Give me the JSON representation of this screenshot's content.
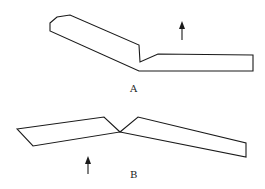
{
  "figures": [
    {
      "id": "A",
      "label": "A",
      "description": "Bent plate / bar shape with arrow pointing up",
      "outline_points": "50,23 57,17 70,15 139,45 140,62 158,54 253,55 253,71 139,71 50,31",
      "arrow": {
        "x": 182,
        "y_start": 40,
        "y_end": 22,
        "direction": "up"
      },
      "label_pos": {
        "x": 130,
        "y": 92
      }
    },
    {
      "id": "B",
      "label": "B",
      "description": "Two plates forming a shallow V with arrow pointing up",
      "left_piece_points": "17,129 104,117 120,132 33,146",
      "right_piece_points": "120,132 138,117 246,143 246,157",
      "arrow": {
        "x": 88,
        "y_start": 174,
        "y_end": 157,
        "direction": "up"
      },
      "label_pos": {
        "x": 130,
        "y": 178
      }
    }
  ],
  "colors": {
    "stroke": "#1a1a1a",
    "background": "#ffffff"
  }
}
